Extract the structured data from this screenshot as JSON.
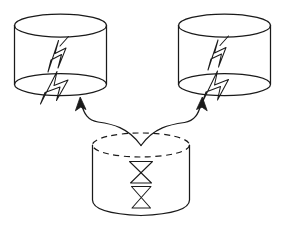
{
  "diagram": {
    "title": "Two source cylinders feeding from a lower dashed cylinder",
    "style": "hand-drawn black line art on white",
    "background_color": "#ffffff",
    "line_color": "#1a1a1a",
    "nodes": [
      {
        "id": "cylinder-top-left",
        "label": "",
        "shape": "cylinder",
        "symbol": "lightning-bolt",
        "symbol_count": 2,
        "top_ellipse_style": "solid",
        "bounds": {
          "x": 14,
          "y": 14,
          "width": 93,
          "height": 78
        }
      },
      {
        "id": "cylinder-top-right",
        "label": "",
        "shape": "cylinder",
        "symbol": "lightning-bolt",
        "symbol_count": 2,
        "top_ellipse_style": "solid",
        "bounds": {
          "x": 178,
          "y": 14,
          "width": 93,
          "height": 78
        }
      },
      {
        "id": "cylinder-bottom",
        "label": "",
        "shape": "cylinder",
        "symbol": "hourglass",
        "symbol_count": 2,
        "top_ellipse_style": "dashed",
        "bounds": {
          "x": 92,
          "y": 133,
          "width": 98,
          "height": 84
        }
      }
    ],
    "connectors": [
      {
        "id": "arrow-bottom-to-left",
        "from": "cylinder-bottom",
        "to": "cylinder-top-left",
        "style": "curved",
        "arrowhead": "solid-triangle",
        "direction": "up-left"
      },
      {
        "id": "arrow-bottom-to-right",
        "from": "cylinder-bottom",
        "to": "cylinder-top-right",
        "style": "curved",
        "arrowhead": "solid-triangle",
        "direction": "up-right"
      }
    ]
  }
}
